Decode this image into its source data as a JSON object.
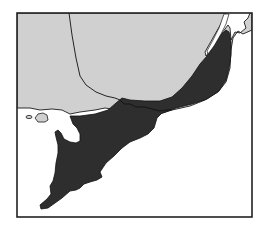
{
  "map": {
    "type": "distribution-range-map",
    "region": "south-eastern coastal region",
    "legend": [],
    "labels": [],
    "colors": {
      "background": "#ffffff",
      "land": "#d0d0d0",
      "range": "#2e2e2e",
      "outline": "#1a1a1a",
      "frame": "#222222"
    },
    "frame": {
      "x": 17,
      "y": 13,
      "width": 235,
      "height": 204
    },
    "layers": [
      {
        "name": "land-mass",
        "fill": "light gray"
      },
      {
        "name": "distribution-range",
        "fill": "dark gray / black"
      },
      {
        "name": "state-boundary",
        "style": "thin black line"
      },
      {
        "name": "offshore-islands",
        "count": 2
      }
    ],
    "accessible_title": "Map showing shaded distribution range along the south-eastern coast"
  }
}
